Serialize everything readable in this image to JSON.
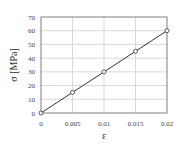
{
  "chart_data": {
    "type": "line",
    "title": "",
    "xlabel": "ε",
    "ylabel": "σ [MPa]",
    "x": [
      0,
      0.005,
      0.01,
      0.015,
      0.02
    ],
    "series": [
      {
        "name": "stress-strain",
        "values": [
          0,
          15,
          30,
          45,
          60
        ],
        "marker": "open-circle",
        "color": "#333333"
      }
    ],
    "xlim": [
      0,
      0.02
    ],
    "ylim": [
      0,
      70
    ],
    "xticks": [
      "0",
      "0.005",
      "0.01",
      "0.015",
      "0.02"
    ],
    "yticks": [
      "0",
      "10",
      "20",
      "30",
      "40",
      "50",
      "60",
      "70"
    ],
    "grid": true,
    "legend": "none"
  },
  "colors": {
    "axis": "#7f7f7f",
    "grid": "#d9d9d9",
    "line": "#333333",
    "text": "#444444"
  }
}
